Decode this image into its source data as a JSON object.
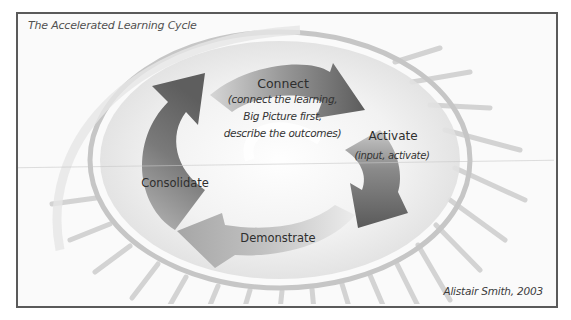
{
  "diagram": {
    "title": "The Accelerated Learning Cycle",
    "credit": "Alistair Smith, 2003",
    "type": "cycle",
    "direction": "clockwise",
    "stages": [
      {
        "name": "Connect",
        "description_lines": [
          "(connect the learning,",
          "Big Picture first,",
          "describe the outcomes)"
        ]
      },
      {
        "name": "Activate",
        "description_lines": [
          "(input, activate)"
        ]
      },
      {
        "name": "Demonstrate",
        "description_lines": []
      },
      {
        "name": "Consolidate",
        "description_lines": []
      }
    ],
    "colors": {
      "frame_border": "#5a5a5a",
      "background": "#fafafa",
      "arrow_dark": "#6b6b6b",
      "arrow_mid": "#8f8f8f",
      "arrow_light": "#b5b5b5",
      "ring": "#c4c4c4",
      "text": "#2e2e2e"
    }
  }
}
